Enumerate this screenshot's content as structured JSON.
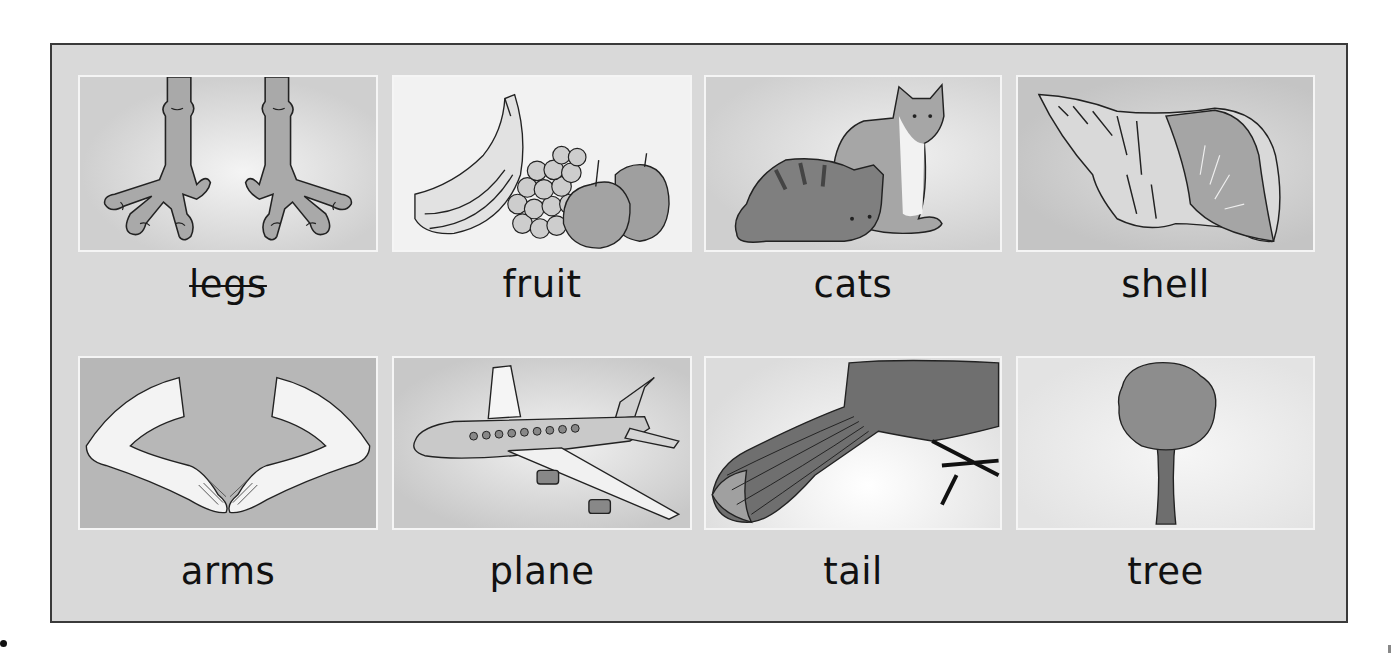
{
  "worksheet": {
    "background_color": "#d9d9d9",
    "border_color": "#3a3a3a",
    "rows": [
      {
        "cards": [
          {
            "word": "legs",
            "struck_through": true,
            "image": "bird-feet-icon",
            "image_bg": "#cfcfcf"
          },
          {
            "word": "fruit",
            "struck_through": false,
            "image": "fruit-bowl-icon",
            "image_bg": "#f2f2f2"
          },
          {
            "word": "cats",
            "struck_through": false,
            "image": "two-cats-icon",
            "image_bg": "#d2d2d2"
          },
          {
            "word": "shell",
            "struck_through": false,
            "image": "sea-shell-icon",
            "image_bg": "#c8c8c8"
          }
        ]
      },
      {
        "cards": [
          {
            "word": "arms",
            "struck_through": false,
            "image": "arms-icon",
            "image_bg": "#b5b5b5"
          },
          {
            "word": "plane",
            "struck_through": false,
            "image": "airplane-icon",
            "image_bg": "#d0d0d0"
          },
          {
            "word": "tail",
            "struck_through": false,
            "image": "bird-tail-icon",
            "image_bg": "#e6e6e6"
          },
          {
            "word": "tree",
            "struck_through": false,
            "image": "tree-icon",
            "image_bg": "#e8e8e8"
          }
        ]
      }
    ]
  }
}
